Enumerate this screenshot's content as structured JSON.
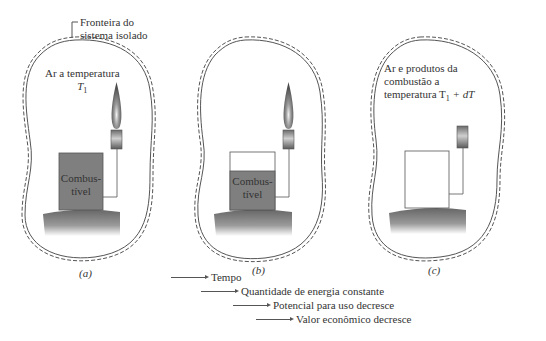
{
  "boundary_label": [
    "Fronteira do",
    "sistema isolado"
  ],
  "panels": [
    {
      "caption": "(a)",
      "air_label": [
        "Ar a temperatura",
        "T",
        "1"
      ],
      "fuel_label": [
        "Combus-",
        "tível"
      ],
      "fuel_fill_percent": 100,
      "flame": true
    },
    {
      "caption": "(b)",
      "fuel_label": [
        "Combus-",
        "tível"
      ],
      "fuel_fill_percent": 55,
      "flame": true
    },
    {
      "caption": "(c)",
      "air_label": [
        "Ar e produtos da",
        "combustão a",
        "temperatura T",
        "1",
        " + dT"
      ],
      "fuel_fill_percent": 0,
      "flame": false
    }
  ],
  "legend": [
    "Tempo",
    "Quantidade de energia constante",
    "Potencial para uso decresce",
    "Valor econômico decresce"
  ],
  "colors": {
    "fuel": "#7f7f7f",
    "ground_top": "#6b6b6b",
    "ground_bottom": "#ffffff",
    "boundary": "#555555",
    "burner": "#8a8a8a"
  }
}
